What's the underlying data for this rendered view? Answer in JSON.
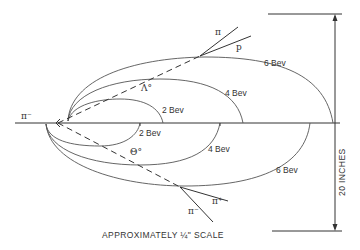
{
  "diagram": {
    "incoming_particle": "π⁻",
    "neutral_upper": "Λ°",
    "neutral_lower": "Θ°",
    "upper_decay": {
      "product1": "π",
      "product2": "p"
    },
    "lower_decay": {
      "product1": "π⁺",
      "product2": "π⁻"
    },
    "upper_tracks": [
      {
        "label": "2 Bev"
      },
      {
        "label": "4 Bev"
      },
      {
        "label": "6 Bev"
      }
    ],
    "lower_tracks": [
      {
        "label": "2 Bev"
      },
      {
        "label": "4 Bev"
      },
      {
        "label": "6 Bev"
      }
    ],
    "scale_bar_label": "20 INCHES",
    "caption": "APPROXIMATELY ¼\" SCALE"
  }
}
